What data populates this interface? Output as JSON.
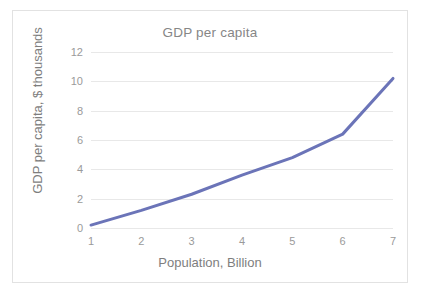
{
  "chart_data": {
    "type": "line",
    "title": "GDP per capita",
    "xlabel": "Population, Billion",
    "ylabel": "GDP per capita, $ thousands",
    "x": [
      1,
      2,
      3,
      4,
      5,
      6,
      7
    ],
    "values": [
      0.2,
      1.2,
      2.3,
      3.6,
      4.8,
      6.4,
      10.2
    ],
    "series": [
      {
        "name": "GDP per capita",
        "values": [
          0.2,
          1.2,
          2.3,
          3.6,
          4.8,
          6.4,
          10.2
        ]
      }
    ],
    "x_tick_labels": [
      "1",
      "2",
      "3",
      "4",
      "5",
      "6",
      "7"
    ],
    "y_tick_labels": [
      "0",
      "2",
      "4",
      "6",
      "8",
      "10",
      "12"
    ],
    "y_ticks": [
      0,
      2,
      4,
      6,
      8,
      10,
      12
    ],
    "xlim": [
      1,
      7
    ],
    "ylim": [
      0,
      12
    ],
    "grid": "horizontal",
    "legend": "none",
    "markers": false,
    "line_color": "#6b74b8",
    "line_width": 3,
    "gridline_color": "#e8e8e8",
    "text_color": "#7e7e7e",
    "tick_text_color": "#9a9a9a",
    "background_color": "#ffffff",
    "border_color": "#e2e2e2"
  }
}
